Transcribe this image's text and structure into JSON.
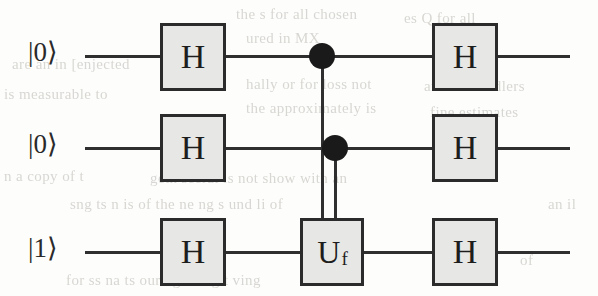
{
  "figure": {
    "type": "quantum-circuit",
    "title": "",
    "qubit_count": 3,
    "wires": [
      {
        "id": "q0",
        "input_label": "|0⟩",
        "y": 56
      },
      {
        "id": "q1",
        "input_label": "|0⟩",
        "y": 148
      },
      {
        "id": "q2",
        "input_label": "|1⟩",
        "y": 252
      }
    ],
    "columns": [
      {
        "id": "col1",
        "label": "first Hadamard layer"
      },
      {
        "id": "col2",
        "label": "oracle layer"
      },
      {
        "id": "col3",
        "label": "second Hadamard layer"
      }
    ],
    "gates": [
      {
        "id": "h-q0-c1",
        "label": "H",
        "wire": "q0",
        "column": "col1",
        "x": 160,
        "y": 23,
        "w": 66,
        "h": 68
      },
      {
        "id": "h-q1-c1",
        "label": "H",
        "wire": "q1",
        "column": "col1",
        "x": 160,
        "y": 114,
        "w": 66,
        "h": 68
      },
      {
        "id": "h-q2-c1",
        "label": "H",
        "wire": "q2",
        "column": "col1",
        "x": 160,
        "y": 218,
        "w": 66,
        "h": 68
      },
      {
        "id": "uf-q2-c2",
        "label": "U",
        "sublabel": "f",
        "wire": "q2",
        "column": "col2",
        "x": 300,
        "y": 218,
        "w": 64,
        "h": 68
      },
      {
        "id": "h-q0-c3",
        "label": "H",
        "wire": "q0",
        "column": "col3",
        "x": 432,
        "y": 23,
        "w": 66,
        "h": 68
      },
      {
        "id": "h-q1-c3",
        "label": "H",
        "wire": "q1",
        "column": "col3",
        "x": 432,
        "y": 114,
        "w": 66,
        "h": 68
      },
      {
        "id": "h-q2-c3",
        "label": "H",
        "wire": "q2",
        "column": "col3",
        "x": 432,
        "y": 218,
        "w": 66,
        "h": 68
      }
    ],
    "controls": [
      {
        "id": "ctrl-q0",
        "wire": "q0",
        "target": "uf-q2-c2",
        "x": 322,
        "y": 56,
        "radius": 13
      },
      {
        "id": "ctrl-q1",
        "wire": "q1",
        "target": "uf-q2-c2",
        "x": 335,
        "y": 148,
        "radius": 13
      }
    ],
    "control_lines": [
      {
        "id": "ctrl-line-q0",
        "from": "ctrl-q0",
        "to": "uf-q2-c2",
        "x": 322,
        "y1": 56,
        "y2": 218
      },
      {
        "id": "ctrl-line-q1",
        "from": "ctrl-q1",
        "to": "uf-q2-c2",
        "x": 335,
        "y1": 148,
        "y2": 218
      }
    ],
    "wire_segments": [
      {
        "id": "seg-q0-a",
        "wire": "q0",
        "x1": 85,
        "x2": 160,
        "y": 56
      },
      {
        "id": "seg-q0-b",
        "wire": "q0",
        "x1": 226,
        "x2": 432,
        "y": 56
      },
      {
        "id": "seg-q0-c",
        "wire": "q0",
        "x1": 498,
        "x2": 570,
        "y": 56
      },
      {
        "id": "seg-q1-a",
        "wire": "q1",
        "x1": 85,
        "x2": 160,
        "y": 148
      },
      {
        "id": "seg-q1-b",
        "wire": "q1",
        "x1": 226,
        "x2": 432,
        "y": 148
      },
      {
        "id": "seg-q1-c",
        "wire": "q1",
        "x1": 498,
        "x2": 570,
        "y": 148
      },
      {
        "id": "seg-q2-a",
        "wire": "q2",
        "x1": 85,
        "x2": 160,
        "y": 252
      },
      {
        "id": "seg-q2-b",
        "wire": "q2",
        "x1": 226,
        "x2": 300,
        "y": 252
      },
      {
        "id": "seg-q2-c",
        "wire": "q2",
        "x1": 364,
        "x2": 432,
        "y": 252
      },
      {
        "id": "seg-q2-d",
        "wire": "q2",
        "x1": 498,
        "x2": 570,
        "y": 252
      }
    ]
  },
  "background_text": {
    "description": "faint illegible bleed-through text from the reverse side of the scanned page",
    "lines": [
      {
        "id": "g1",
        "text": "the  s  for  all  chosen",
        "x": 236,
        "y": 6
      },
      {
        "id": "g2",
        "text": "es Q for all",
        "x": 404,
        "y": 10
      },
      {
        "id": "g3",
        "text": "ured    in    MX",
        "x": 246,
        "y": 30
      },
      {
        "id": "g4",
        "text": "ion",
        "x": 436,
        "y": 34
      },
      {
        "id": "g5",
        "text": "are   an   in   [enjected",
        "x": 12,
        "y": 56
      },
      {
        "id": "g6",
        "text": "hally  or  for  loss  not",
        "x": 246,
        "y": 76
      },
      {
        "id": "g7",
        "text": "and   un   handlers",
        "x": 424,
        "y": 78
      },
      {
        "id": "g8",
        "text": "is  measurable  to",
        "x": 4,
        "y": 86
      },
      {
        "id": "g9",
        "text": "the  approximately  is",
        "x": 246,
        "y": 100
      },
      {
        "id": "g10",
        "text": "fine  estimates",
        "x": 430,
        "y": 104
      },
      {
        "id": "g11",
        "text": "n a copy of   t",
        "x": 4,
        "y": 168
      },
      {
        "id": "g12",
        "text": "geth   seeral  is    not  show  with  an",
        "x": 150,
        "y": 170
      },
      {
        "id": "g13",
        "text": "sng  ts  n  is  of  the  ne  ng  s  und  li  of",
        "x": 70,
        "y": 196
      },
      {
        "id": "g14",
        "text": "an  il",
        "x": 548,
        "y": 196
      },
      {
        "id": "g15",
        "text": "for  ss  na  ts  our  ng  ne  og  t  ving",
        "x": 66,
        "y": 272
      },
      {
        "id": "g16",
        "text": "of",
        "x": 520,
        "y": 252
      }
    ]
  }
}
